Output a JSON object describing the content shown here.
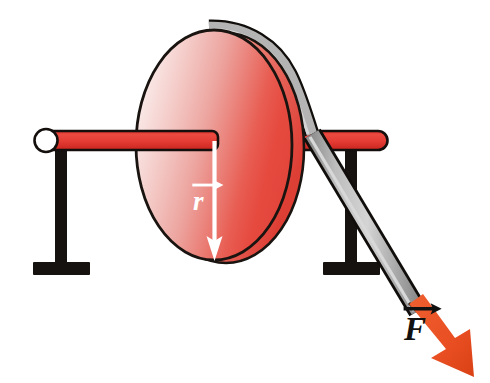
{
  "figure": {
    "background_color": "#ffffff"
  },
  "labels": {
    "radius_vector": {
      "symbol": "r",
      "name": "radius-vector-label",
      "color": "#ffffff",
      "description": "radius vector r from axle center to rim"
    },
    "force_vector": {
      "symbol": "F",
      "name": "force-vector-label",
      "color": "#111111",
      "description": "force vector F applied by the belt"
    }
  },
  "parts": {
    "disk": {
      "name": "red-disk",
      "gradient_light": "#f9e3e2",
      "gradient_mid": "#f0a9a4",
      "gradient_dark": "#e8453c",
      "outline_color": "#1a1411",
      "center_x": 214,
      "center_y": 145,
      "radius_x": 78,
      "radius_y": 115
    },
    "axle_rod": {
      "name": "red-axle-rod",
      "color": "#e03a32",
      "outline_color": "#140f0d",
      "cap_color": "#ffffff"
    },
    "left_stand": {
      "name": "left-i-beam-stand",
      "color": "#151210"
    },
    "right_stand": {
      "name": "right-i-beam-stand",
      "color": "#151210"
    },
    "belt": {
      "name": "gray-belt-strap",
      "color": "#ababab",
      "highlight_color": "#d2d2d2",
      "outline_color": "#100d0b"
    },
    "force_arrow": {
      "name": "force-arrow",
      "color": "#ea5228",
      "shade_color": "#cf3f19"
    },
    "radius_arrow": {
      "name": "radius-arrow",
      "color": "#ffffff"
    }
  }
}
